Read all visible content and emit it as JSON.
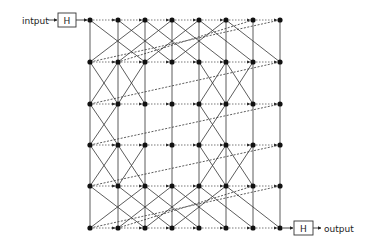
{
  "diagram": {
    "input_label": "intput",
    "output_label": "output",
    "input_block_label": "H",
    "output_block_label": "H",
    "columns_x": [
      90,
      118,
      145,
      172,
      199,
      226,
      253,
      280
    ],
    "rows_y": [
      20,
      62,
      104,
      145,
      186,
      228
    ],
    "colors": {
      "line": "#333333",
      "node": "#111111",
      "dotted": "#555555"
    },
    "diagonals": [
      {
        "from": [
          0,
          0
        ],
        "to": [
          2,
          1
        ]
      },
      {
        "from": [
          1,
          0
        ],
        "to": [
          3,
          1
        ]
      },
      {
        "from": [
          2,
          0
        ],
        "to": [
          4,
          1
        ]
      },
      {
        "from": [
          3,
          0
        ],
        "to": [
          5,
          1
        ]
      },
      {
        "from": [
          4,
          0
        ],
        "to": [
          6,
          1
        ]
      },
      {
        "from": [
          5,
          0
        ],
        "to": [
          7,
          1
        ]
      },
      {
        "from": [
          2,
          0
        ],
        "to": [
          0,
          1
        ]
      },
      {
        "from": [
          3,
          0
        ],
        "to": [
          1,
          1
        ]
      },
      {
        "from": [
          4,
          0
        ],
        "to": [
          2,
          1
        ]
      },
      {
        "from": [
          5,
          0
        ],
        "to": [
          3,
          1
        ]
      },
      {
        "from": [
          6,
          0
        ],
        "to": [
          1,
          1
        ]
      },
      {
        "from": [
          7,
          0
        ],
        "to": [
          0,
          1
        ]
      },
      {
        "from": [
          0,
          1
        ],
        "to": [
          1,
          2
        ]
      },
      {
        "from": [
          1,
          1
        ],
        "to": [
          0,
          2
        ]
      },
      {
        "from": [
          1,
          1
        ],
        "to": [
          2,
          2
        ]
      },
      {
        "from": [
          2,
          1
        ],
        "to": [
          1,
          2
        ]
      },
      {
        "from": [
          4,
          1
        ],
        "to": [
          5,
          2
        ]
      },
      {
        "from": [
          5,
          1
        ],
        "to": [
          4,
          2
        ]
      },
      {
        "from": [
          5,
          1
        ],
        "to": [
          6,
          2
        ]
      },
      {
        "from": [
          6,
          1
        ],
        "to": [
          5,
          2
        ]
      },
      {
        "from": [
          7,
          1
        ],
        "to": [
          0,
          2
        ]
      },
      {
        "from": [
          0,
          2
        ],
        "to": [
          1,
          3
        ]
      },
      {
        "from": [
          1,
          2
        ],
        "to": [
          0,
          3
        ]
      },
      {
        "from": [
          4,
          2
        ],
        "to": [
          5,
          3
        ]
      },
      {
        "from": [
          5,
          2
        ],
        "to": [
          4,
          3
        ]
      },
      {
        "from": [
          7,
          2
        ],
        "to": [
          0,
          3
        ]
      },
      {
        "from": [
          0,
          3
        ],
        "to": [
          1,
          4
        ]
      },
      {
        "from": [
          1,
          3
        ],
        "to": [
          0,
          4
        ]
      },
      {
        "from": [
          1,
          3
        ],
        "to": [
          2,
          4
        ]
      },
      {
        "from": [
          2,
          3
        ],
        "to": [
          1,
          4
        ]
      },
      {
        "from": [
          4,
          3
        ],
        "to": [
          5,
          4
        ]
      },
      {
        "from": [
          5,
          3
        ],
        "to": [
          4,
          4
        ]
      },
      {
        "from": [
          5,
          3
        ],
        "to": [
          6,
          4
        ]
      },
      {
        "from": [
          6,
          3
        ],
        "to": [
          5,
          4
        ]
      },
      {
        "from": [
          7,
          3
        ],
        "to": [
          0,
          4
        ]
      },
      {
        "from": [
          0,
          4
        ],
        "to": [
          2,
          5
        ]
      },
      {
        "from": [
          1,
          4
        ],
        "to": [
          3,
          5
        ]
      },
      {
        "from": [
          2,
          4
        ],
        "to": [
          4,
          5
        ]
      },
      {
        "from": [
          3,
          4
        ],
        "to": [
          5,
          5
        ]
      },
      {
        "from": [
          4,
          4
        ],
        "to": [
          6,
          5
        ]
      },
      {
        "from": [
          5,
          4
        ],
        "to": [
          7,
          5
        ]
      },
      {
        "from": [
          2,
          4
        ],
        "to": [
          0,
          5
        ]
      },
      {
        "from": [
          3,
          4
        ],
        "to": [
          1,
          5
        ]
      },
      {
        "from": [
          4,
          4
        ],
        "to": [
          2,
          5
        ]
      },
      {
        "from": [
          5,
          4
        ],
        "to": [
          3,
          5
        ]
      },
      {
        "from": [
          6,
          4
        ],
        "to": [
          1,
          5
        ]
      },
      {
        "from": [
          7,
          4
        ],
        "to": [
          0,
          5
        ]
      }
    ]
  }
}
